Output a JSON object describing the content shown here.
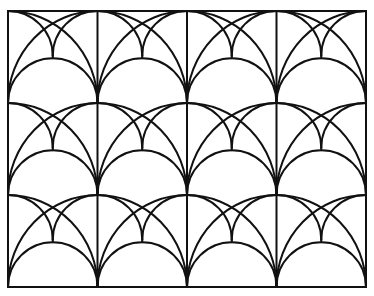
{
  "figure": {
    "colors": {
      "background": "#ffffff",
      "line": "#111111"
    },
    "frame": {
      "x": 8,
      "y": 11,
      "width": 358,
      "height": 276
    },
    "grid": {
      "columns": 4,
      "rows": 3
    },
    "line_width": 2
  }
}
